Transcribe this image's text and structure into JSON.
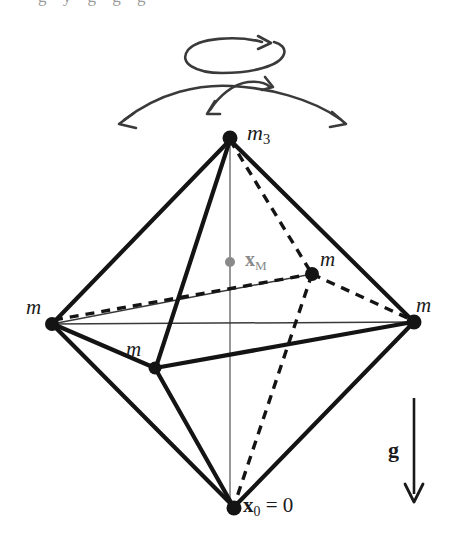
{
  "figure": {
    "background_color": "#ffffff",
    "stroke_color": "#1a1a1a",
    "thin_stroke_color": "#3a3a3a",
    "axis_color": "#7d7d7d",
    "center_marker_color": "#8a8a8a",
    "width": 453,
    "height": 538
  },
  "cropped_header": {
    "text": "g y g g g"
  },
  "vertices": [
    {
      "id": "top",
      "name": "apex-mass",
      "label": "m",
      "subscript": "3",
      "x": 230,
      "y": 138,
      "dot_r": 7.5,
      "color": "#141414",
      "label_x": 247,
      "label_y": 122
    },
    {
      "id": "left",
      "name": "left-mass",
      "label": "m",
      "subscript": "",
      "x": 52,
      "y": 324,
      "dot_r": 7.0,
      "color": "#141414",
      "label_x": 26,
      "label_y": 296
    },
    {
      "id": "right",
      "name": "right-mass",
      "label": "m",
      "subscript": "",
      "x": 414,
      "y": 322,
      "dot_r": 7.5,
      "color": "#141414",
      "label_x": 416,
      "label_y": 295
    },
    {
      "id": "front",
      "name": "front-mass",
      "label": "m",
      "subscript": "",
      "x": 155,
      "y": 368,
      "dot_r": 6.5,
      "color": "#141414",
      "label_x": 126,
      "label_y": 338
    },
    {
      "id": "back",
      "name": "back-mass",
      "label": "m",
      "subscript": "",
      "x": 312,
      "y": 274,
      "dot_r": 7.0,
      "color": "#141414",
      "label_x": 320,
      "label_y": 248
    },
    {
      "id": "bottom",
      "name": "origin-mass",
      "label": "x",
      "subscript": "0",
      "x": 234,
      "y": 508,
      "dot_r": 7.5,
      "color": "#141414",
      "label_x": 243,
      "label_y": 494
    }
  ],
  "labels": {
    "apex": {
      "base": "m",
      "sub": "3"
    },
    "mass": "m",
    "center_of_mass": {
      "base": "x",
      "sub": "M"
    },
    "origin": {
      "base": "x",
      "sub": "0",
      "equals": " = 0"
    },
    "gravity": "g"
  },
  "center_of_mass": {
    "name": "center-of-mass-marker",
    "x": 230,
    "y": 262,
    "dot_r": 5.0,
    "color": "#8a8a8a",
    "label_x": 244,
    "label_y": 248
  },
  "vertical_axis": {
    "name": "symmetry-axis",
    "x": 230,
    "y1": 140,
    "y2": 506,
    "color": "#7d7d7d",
    "width": 1.6
  },
  "edges_solid": [
    {
      "from": "top",
      "to": "left"
    },
    {
      "from": "top",
      "to": "right"
    },
    {
      "from": "top",
      "to": "front"
    },
    {
      "from": "left",
      "to": "front"
    },
    {
      "from": "front",
      "to": "right"
    },
    {
      "from": "left",
      "to": "bottom"
    },
    {
      "from": "right",
      "to": "bottom"
    },
    {
      "from": "front",
      "to": "bottom"
    }
  ],
  "edges_thin": [
    {
      "from": "left",
      "to": "right",
      "note": "horizontal-diagonal"
    },
    {
      "from": "left",
      "to": "back",
      "note": "diagonal-to-back"
    }
  ],
  "edges_dashed": [
    {
      "from": "top",
      "to": "back"
    },
    {
      "from": "left",
      "to": "back"
    },
    {
      "from": "right",
      "to": "back"
    },
    {
      "from": "back",
      "to": "bottom"
    }
  ],
  "gravity_arrow": {
    "name": "gravity-vector",
    "x": 414,
    "y1": 398,
    "y2": 500,
    "label": "g",
    "label_x": 390,
    "label_y": 440,
    "color": "#1a1a1a"
  },
  "rotation_arrow": {
    "name": "spin-rotation-arrow",
    "type": "ellipse-loop",
    "cx": 234,
    "cy": 56,
    "rx": 50,
    "ry": 17,
    "direction": "counterclockwise-viewed-from-above"
  },
  "swing_arrows": {
    "name": "swing-oscillation-arrows",
    "outer": {
      "start_x": 118,
      "start_y": 124,
      "peak_x": 232,
      "peak_y": 88,
      "end_x": 346,
      "end_y": 123,
      "double_headed": true
    },
    "inner": {
      "start_x": 206,
      "start_y": 113,
      "peak_x": 242,
      "peak_y": 82,
      "end_x": 272,
      "end_y": 86,
      "double_headed": true
    }
  }
}
